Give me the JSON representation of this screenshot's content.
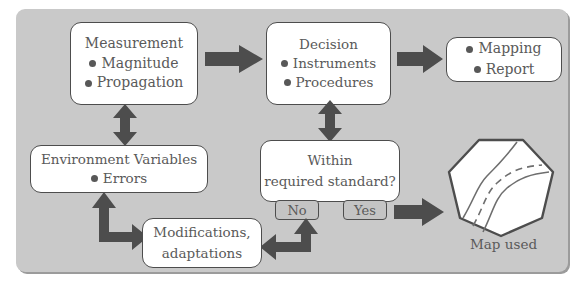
{
  "diagram": {
    "panel_color": "#c9c9c9",
    "box_fill": "#ffffff",
    "box_border": "#4d4d4d",
    "arrow_color": "#4d4d4d",
    "text_color": "#5a5a5a"
  },
  "boxes": {
    "measurement": {
      "heading": "Measurement",
      "items": [
        "Magnitude",
        "Propagation"
      ]
    },
    "decision": {
      "heading": "Decision",
      "items": [
        "Instruments",
        "Procedures"
      ]
    },
    "output": {
      "items": [
        "Mapping",
        "Report"
      ]
    },
    "environment": {
      "heading": "Environment Variables",
      "items": [
        "Errors"
      ]
    },
    "within": {
      "line1": "Within",
      "line2": "required standard?"
    },
    "modifications": {
      "line1": "Modifications,",
      "line2": "adaptations"
    }
  },
  "branches": {
    "no_label": "No",
    "yes_label": "Yes"
  },
  "map": {
    "label_line1": "Map",
    "label_line2": "used",
    "shape": "heptagon",
    "curves": [
      "solid-left",
      "dashed-center",
      "solid-right"
    ]
  },
  "arrows": [
    {
      "name": "measurement-to-decision",
      "direction": "right"
    },
    {
      "name": "decision-to-output",
      "direction": "right"
    },
    {
      "name": "measurement-environment",
      "direction": "up-down"
    },
    {
      "name": "decision-within",
      "direction": "up-down"
    },
    {
      "name": "environment-to-modifications",
      "direction": "elbow-up-right"
    },
    {
      "name": "no-to-modifications",
      "direction": "elbow-up-left"
    },
    {
      "name": "yes-to-map",
      "direction": "right"
    }
  ]
}
